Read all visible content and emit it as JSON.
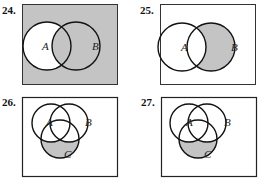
{
  "colors": {
    "shade": "#c4c4c4",
    "stroke": "#111111",
    "background": "#ffffff"
  },
  "problems": [
    {
      "number": "24.",
      "sets": [
        "A",
        "B"
      ],
      "shaded": "universe minus A (complement of A, including A∩B? no — region B and outside shaded, A-only white)"
    },
    {
      "number": "25.",
      "sets": [
        "A",
        "B"
      ],
      "shaded": "B minus A"
    },
    {
      "number": "26.",
      "sets": [
        "A",
        "B",
        "C"
      ],
      "shaded": "C minus (A ∪ B)"
    },
    {
      "number": "27.",
      "sets": [
        "A",
        "B",
        "C"
      ],
      "shaded": "C minus (A ∪ B)"
    }
  ]
}
